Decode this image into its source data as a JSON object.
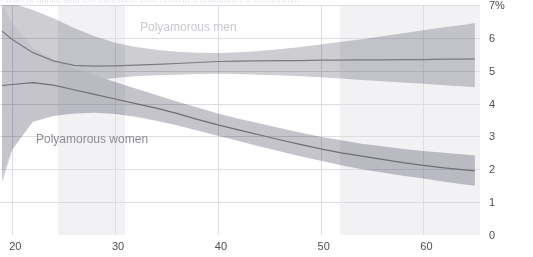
{
  "chart": {
    "title_sliver": "Share of adults who say they have ever been in a polyamorous relationship",
    "y_axis": {
      "ticks": [
        "7%",
        "6",
        "5",
        "4",
        "3",
        "2",
        "1",
        "0"
      ],
      "values": [
        7,
        6,
        5,
        4,
        3,
        2,
        1,
        0
      ],
      "unit": "%"
    },
    "x_axis": {
      "ticks": [
        "20",
        "30",
        "40",
        "50",
        "60"
      ],
      "values": [
        20,
        30,
        40,
        50,
        60
      ],
      "label": ""
    },
    "series_labels": {
      "men": "Polyamorous men",
      "women": "Polyamorous women"
    },
    "colors": {
      "band_men": "#cdcdd2",
      "band_women": "#c4c4ca",
      "band_overlap": "#b3b3b9",
      "line_men": "#7a7a80",
      "line_women": "#6e6e74",
      "gridline": "#dcdce2",
      "background": "#ffffff",
      "vband": "#f2f2f5",
      "axis_text": "#4d4d52"
    }
  },
  "chart_data": {
    "type": "line",
    "title": "Share of adults who say they have ever been in a polyamorous relationship",
    "subtitle": "",
    "xlabel": "Age",
    "ylabel": "Share of adults (%)",
    "xlim": [
      18.8,
      65.5
    ],
    "ylim": [
      0,
      7
    ],
    "grid": true,
    "legend": "inline-labels",
    "x": [
      19,
      20,
      22,
      24,
      26,
      28,
      30,
      32,
      34,
      36,
      38,
      40,
      42,
      44,
      46,
      48,
      50,
      52,
      54,
      56,
      58,
      60,
      62,
      64,
      65
    ],
    "series": [
      {
        "name": "Polyamorous men",
        "label_text": "Polyamorous men",
        "color": "#7a7a80",
        "band_color": "#cdcdd2",
        "values": [
          6.2,
          5.95,
          5.55,
          5.3,
          5.16,
          5.14,
          5.15,
          5.17,
          5.19,
          5.22,
          5.25,
          5.28,
          5.29,
          5.3,
          5.31,
          5.31,
          5.32,
          5.32,
          5.33,
          5.33,
          5.34,
          5.34,
          5.35,
          5.35,
          5.36
        ],
        "ci_lower": [
          1.6,
          2.6,
          3.7,
          4.25,
          4.55,
          4.7,
          4.78,
          4.83,
          4.86,
          4.88,
          4.9,
          4.91,
          4.9,
          4.88,
          4.86,
          4.83,
          4.8,
          4.76,
          4.72,
          4.68,
          4.64,
          4.6,
          4.56,
          4.52,
          4.5
        ],
        "ci_upper": [
          7.2,
          7.05,
          6.85,
          6.6,
          6.3,
          6.05,
          5.85,
          5.72,
          5.64,
          5.58,
          5.55,
          5.54,
          5.56,
          5.6,
          5.65,
          5.72,
          5.8,
          5.88,
          5.96,
          6.05,
          6.14,
          6.23,
          6.32,
          6.4,
          6.45
        ]
      },
      {
        "name": "Polyamorous women",
        "label_text": "Polyamorous women",
        "color": "#6e6e74",
        "band_color": "#c4c4ca",
        "values": [
          4.55,
          4.58,
          4.64,
          4.56,
          4.42,
          4.28,
          4.14,
          4.0,
          3.86,
          3.7,
          3.52,
          3.35,
          3.2,
          3.05,
          2.9,
          2.76,
          2.62,
          2.5,
          2.4,
          2.3,
          2.2,
          2.12,
          2.04,
          1.98,
          1.95
        ],
        "ci_lower": [
          1.95,
          2.6,
          3.45,
          3.62,
          3.7,
          3.72,
          3.68,
          3.6,
          3.48,
          3.34,
          3.18,
          3.02,
          2.86,
          2.7,
          2.55,
          2.4,
          2.26,
          2.12,
          2.0,
          1.9,
          1.8,
          1.72,
          1.62,
          1.54,
          1.5
        ],
        "ci_upper": [
          7.0,
          6.45,
          5.7,
          5.35,
          5.08,
          4.86,
          4.66,
          4.46,
          4.26,
          4.06,
          3.88,
          3.7,
          3.54,
          3.4,
          3.26,
          3.12,
          2.99,
          2.88,
          2.78,
          2.7,
          2.62,
          2.56,
          2.5,
          2.45,
          2.42
        ]
      }
    ]
  }
}
